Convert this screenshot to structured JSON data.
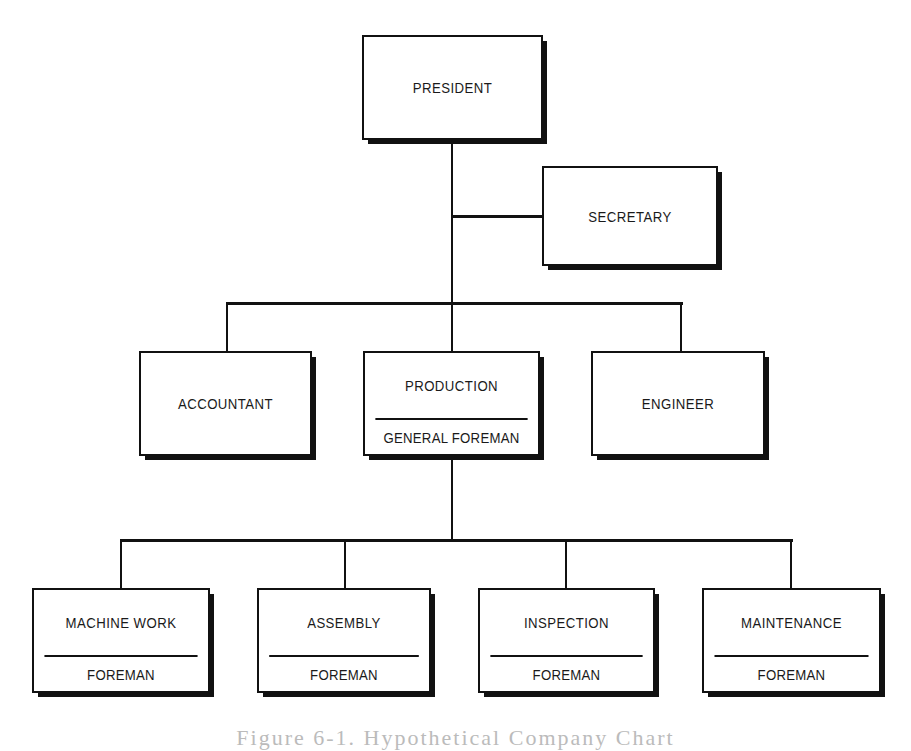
{
  "chart": {
    "nodes": {
      "president": {
        "title": "PRESIDENT"
      },
      "secretary": {
        "title": "SECRETARY"
      },
      "accountant": {
        "title": "ACCOUNTANT"
      },
      "production": {
        "title": "PRODUCTION",
        "subtitle": "GENERAL FOREMAN"
      },
      "engineer": {
        "title": "ENGINEER"
      },
      "machine_work": {
        "title": "MACHINE WORK",
        "subtitle": "FOREMAN"
      },
      "assembly": {
        "title": "ASSEMBLY",
        "subtitle": "FOREMAN"
      },
      "inspection": {
        "title": "INSPECTION",
        "subtitle": "FOREMAN"
      },
      "maintenance": {
        "title": "MAINTENANCE",
        "subtitle": "FOREMAN"
      }
    },
    "caption": "Figure 6-1. Hypothetical Company Chart"
  }
}
